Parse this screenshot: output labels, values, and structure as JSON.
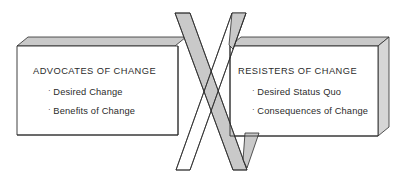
{
  "diagram": {
    "type": "crossing-arrows-force-field",
    "background_color": "#ffffff",
    "outline_color": "#2b2b2b",
    "face_fill": "#ffffff",
    "shade_fill": "#c9c9c9",
    "shade_fill_light": "#d6d6d6",
    "shade_fill_dark": "#b8b8b8"
  },
  "left_panel": {
    "name": "advocates-panel",
    "heading": "ADVOCATES OF CHANGE",
    "bullet_marker": "·",
    "bullets": [
      "Desired Change",
      "Benefits of Change"
    ]
  },
  "right_panel": {
    "name": "resisters-panel",
    "heading": "RESISTERS OF CHANGE",
    "bullet_marker": "·",
    "bullets": [
      "Desired Status Quo",
      "Consequences of Change"
    ]
  },
  "arrows": {
    "left_to_right": {
      "name": "advocates-arrow",
      "direction": "down-right",
      "shaded": true
    },
    "right_to_left": {
      "name": "resisters-arrow",
      "direction": "down-left",
      "shaded": true
    }
  }
}
